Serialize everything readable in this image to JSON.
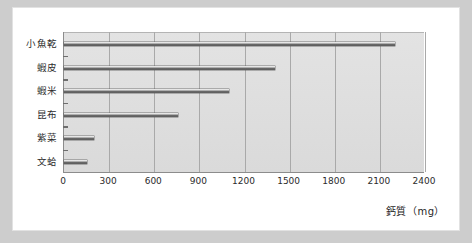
{
  "chart_data": {
    "type": "bar",
    "orientation": "horizontal",
    "title": "",
    "xlabel": "鈣質（mg）",
    "ylabel": "",
    "categories": [
      "小魚乾",
      "蝦皮",
      "蝦米",
      "昆布",
      "紫菜",
      "文蛤"
    ],
    "values": [
      2200,
      1400,
      1100,
      760,
      200,
      150
    ],
    "xlim": [
      0,
      2400
    ],
    "xticks": [
      0,
      300,
      600,
      900,
      1200,
      1500,
      1800,
      2100,
      2400
    ],
    "xtick_labels": [
      "0",
      "300",
      "600",
      "900",
      "1200",
      "1500",
      "1800",
      "2100",
      "2400"
    ],
    "grid": "vertical",
    "legend": "none",
    "series": [
      {
        "name": "鈣質",
        "values": [
          2200,
          1400,
          1100,
          760,
          200,
          150
        ]
      }
    ]
  },
  "colors": {
    "page_background": "#cdcdcd",
    "card_background": "#ffffff",
    "plot_background": "#dedede",
    "gridline": "#a9a9a9",
    "axis": "#8c8c8c",
    "bar_dark": "#4e4e4e",
    "bar_light": "#f4f4f4",
    "text": "#2b2b2b"
  }
}
